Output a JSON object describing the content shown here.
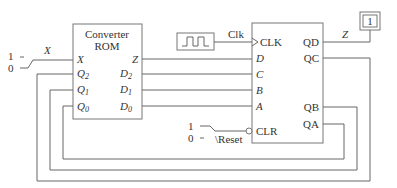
{
  "rom": {
    "title1": "Converter",
    "title2": "ROM",
    "inputs": [
      "X",
      "Q",
      "Q",
      "Q"
    ],
    "input_subs": [
      "",
      "2",
      "1",
      "0"
    ],
    "outputs": [
      "Z",
      "D",
      "D",
      "D"
    ],
    "output_subs": [
      "",
      "2",
      "1",
      "0"
    ]
  },
  "counter": {
    "clk": "CLK",
    "inputs": [
      "D",
      "C",
      "B",
      "A"
    ],
    "outputs": [
      "QD",
      "QC",
      "QB",
      "QA"
    ],
    "clr": "CLR"
  },
  "clock_label": "Clk",
  "x_switch": {
    "label": "X",
    "one": "1",
    "zero": "0"
  },
  "reset_switch": {
    "label": "\\Reset",
    "one": "1",
    "zero": "0"
  },
  "output": {
    "label": "Z",
    "value": "1"
  }
}
